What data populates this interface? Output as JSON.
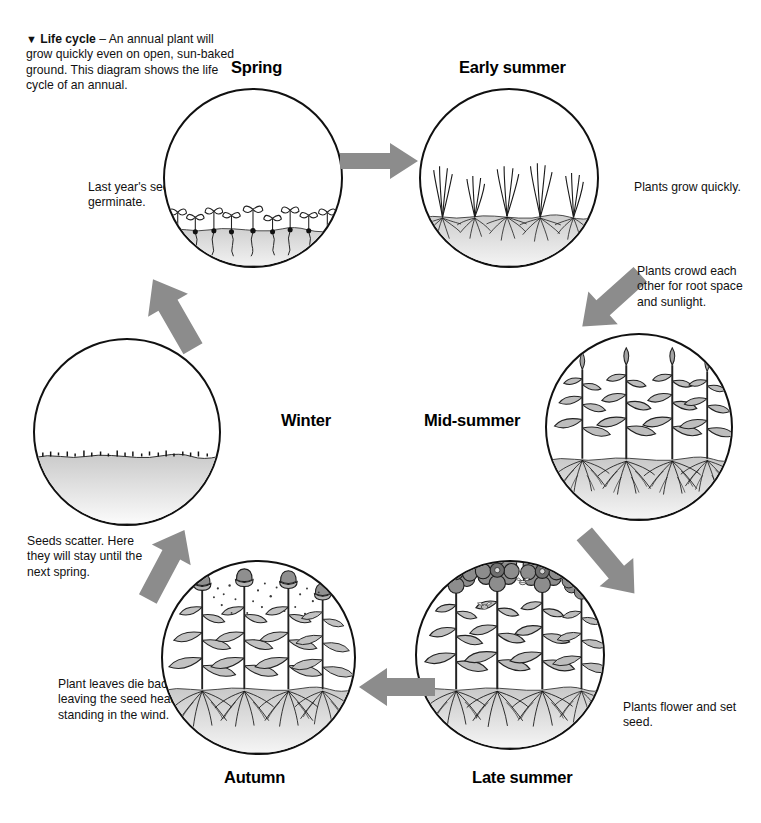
{
  "figure": {
    "caption_marker": "▼",
    "caption_title": "Life cycle",
    "caption_body": " – An annual plant will grow quickly even on open, sun-baked ground. This diagram shows the life cycle of an annual.",
    "caption_full": "▼ Life cycle – An annual plant will grow quickly even on open, sun-baked ground. This diagram shows the life cycle of an annual."
  },
  "colors": {
    "outline": "#111111",
    "arrow_gray": "#8c8c8c",
    "soil_gray": "#c9c9c9",
    "plant_gray": "#9a9a9a",
    "background": "#ffffff"
  },
  "stages": [
    {
      "id": "spring",
      "label": "Spring",
      "note": "Last year's seeds germinate.",
      "scene": "seedlings-with-cotyledons-and-seeds-at-soil-line"
    },
    {
      "id": "early-summer",
      "label": "Early summer",
      "note": "Plants grow quickly.",
      "scene": "young-grass-like-plants-with-roots"
    },
    {
      "id": "mid-summer",
      "label": "Mid-summer",
      "note": "Plants crowd each other for root space and sunlight.",
      "scene": "tall-leafy-plants-with-buds-and-deep-roots"
    },
    {
      "id": "late-summer",
      "label": "Late summer",
      "note": "Plants flower and set seed.",
      "scene": "flowering-plants-with-bees"
    },
    {
      "id": "autumn",
      "label": "Autumn",
      "note": "Plant leaves die back, leaving the seed heads standing in the wind.",
      "scene": "seed-heads-shedding-seeds"
    },
    {
      "id": "winter",
      "label": "Winter",
      "note": "Seeds scatter. Here they will stay until the next spring.",
      "scene": "bare-ground-with-scattered-seeds"
    }
  ],
  "arrows": [
    {
      "id": "spring-to-early-summer",
      "direction": "right"
    },
    {
      "id": "early-summer-to-mid-summer",
      "direction": "down-right"
    },
    {
      "id": "mid-summer-to-late-summer",
      "direction": "down-left"
    },
    {
      "id": "late-summer-to-autumn",
      "direction": "left"
    },
    {
      "id": "autumn-to-winter",
      "direction": "up-left"
    },
    {
      "id": "winter-to-spring",
      "direction": "up-right"
    }
  ]
}
